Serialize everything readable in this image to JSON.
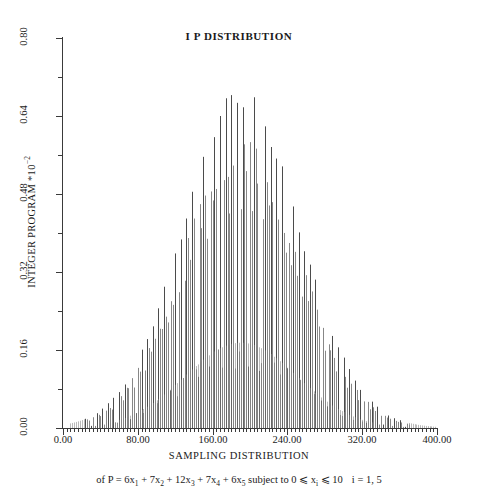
{
  "figure": {
    "title": "I P DISTRIBUTION",
    "caption_prefix": "of P = 6x",
    "caption": "of P = 6x1 + 7x2 + 12x3 + 7x4 + 6x5 subject to 0 ⩽ xi ⩽ 10   i = 1, 5",
    "caption_parts": {
      "p1": "of P = 6x",
      "s1": "1",
      "p2": " + 7x",
      "s2": "2",
      "p3": " + 12x",
      "s3": "3",
      "p4": " + 7x",
      "s4": "4",
      "p5": " + 6x",
      "s5": "5",
      "p6": " subject to 0 ⩽ x",
      "s6": "i",
      "p7": " ⩽ 10",
      "p8": "i = 1, 5"
    }
  },
  "chart_data": {
    "type": "bar",
    "title": "I P DISTRIBUTION",
    "subtitle": "",
    "xlabel": "SAMPLING DISTRIBUTION",
    "ylabel": "INTEGER PROGRAM *10⁻²",
    "ylabel_text": "INTEGER PROGRAM *10",
    "ylabel_exponent": "−2",
    "xlim": [
      0,
      400
    ],
    "ylim": [
      0,
      0.8
    ],
    "grid": false,
    "legend": null,
    "xticks": [
      0,
      80,
      160,
      240,
      320,
      400
    ],
    "xticklabels": [
      "0.00",
      "80.00",
      "160.00",
      "240.00",
      "320.00",
      "400.00"
    ],
    "yticks": [
      0.0,
      0.16,
      0.32,
      0.48,
      0.64,
      0.8
    ],
    "yticklabels": [
      "0.00",
      "0.16",
      "0.32",
      "0.48",
      "0.64",
      "0.80"
    ],
    "x_minor_tick_step": 4,
    "y_minor_tick_step": 0.08,
    "series": [
      {
        "name": "outer envelope (upper spike tips)",
        "peak_x": 190,
        "peak_y": 0.7,
        "mean": 190,
        "stddev": 62,
        "x_start": 24,
        "x_end": 370
      },
      {
        "name": "inner envelope (short spike tips)",
        "peak_x": 190,
        "peak_y": 0.175,
        "mean": 190,
        "stddev": 60,
        "x_start": 60,
        "x_end": 330
      }
    ],
    "spike_spacing_x": 2,
    "major_spike_period": 3,
    "line_color": "#555555",
    "axis_color": "#3a3a3a",
    "background_color": "#ffffff"
  }
}
